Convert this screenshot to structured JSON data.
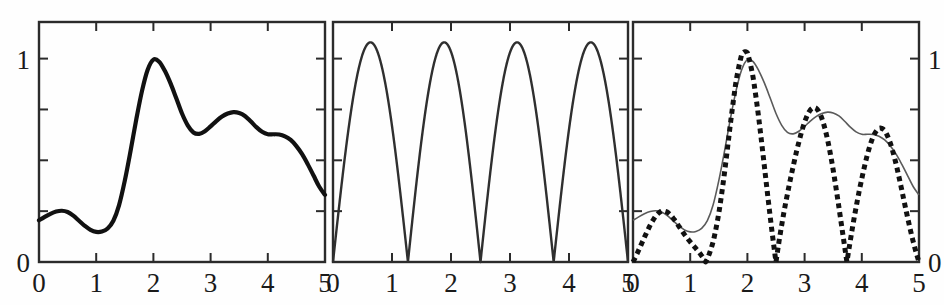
{
  "figure": {
    "title": "",
    "background_color": "#fefefe",
    "line_color": "#111111",
    "thin_line_color": "#4a4a4a",
    "axis_color": "#2b2b2b",
    "panel_count": 3
  },
  "chart_data": [
    {
      "type": "line",
      "panel": "left",
      "title": "",
      "xlabel": "",
      "ylabel": "",
      "xlim": [
        0,
        5
      ],
      "ylim": [
        0,
        1.18
      ],
      "grid": false,
      "legend": null,
      "xticks": [
        0,
        1,
        2,
        3,
        4,
        5
      ],
      "xticklabels": [
        "0",
        "1",
        "2",
        "3",
        "4",
        "5"
      ],
      "yticks": [
        0,
        0.25,
        0.5,
        0.75,
        1
      ],
      "yticklabels_shown": {
        "0": "0",
        "1": "1"
      },
      "ytick_label_side": "left",
      "series": [
        {
          "name": "envelope",
          "style": "solid-thick",
          "color": "#111111",
          "linewidth": 4.2,
          "x": [
            0.0,
            0.1,
            0.2,
            0.3,
            0.4,
            0.5,
            0.6,
            0.7,
            0.8,
            0.9,
            1.0,
            1.1,
            1.2,
            1.3,
            1.4,
            1.5,
            1.6,
            1.7,
            1.8,
            1.9,
            2.0,
            2.1,
            2.2,
            2.3,
            2.4,
            2.5,
            2.6,
            2.7,
            2.8,
            2.9,
            3.0,
            3.1,
            3.2,
            3.3,
            3.4,
            3.5,
            3.6,
            3.7,
            3.8,
            3.9,
            4.0,
            4.1,
            4.2,
            4.3,
            4.4,
            4.5,
            4.6,
            4.7,
            4.8,
            4.9,
            5.0
          ],
          "y": [
            0.205,
            0.222,
            0.237,
            0.248,
            0.252,
            0.246,
            0.228,
            0.203,
            0.178,
            0.158,
            0.148,
            0.15,
            0.165,
            0.203,
            0.28,
            0.4,
            0.545,
            0.7,
            0.84,
            0.945,
            0.995,
            0.985,
            0.94,
            0.878,
            0.805,
            0.73,
            0.672,
            0.637,
            0.63,
            0.643,
            0.667,
            0.693,
            0.715,
            0.73,
            0.737,
            0.733,
            0.718,
            0.692,
            0.663,
            0.64,
            0.628,
            0.628,
            0.627,
            0.618,
            0.6,
            0.57,
            0.53,
            0.48,
            0.425,
            0.37,
            0.33
          ]
        }
      ]
    },
    {
      "type": "line",
      "panel": "middle",
      "title": "",
      "xlabel": "",
      "ylabel": "",
      "xlim": [
        0,
        5
      ],
      "ylim": [
        0,
        1.18
      ],
      "grid": false,
      "legend": null,
      "xticks": [
        0,
        1,
        2,
        3,
        4,
        5
      ],
      "xticklabels": [
        "0",
        "1",
        "2",
        "3",
        "4",
        "5"
      ],
      "yticks": [
        0,
        0.25,
        0.5,
        0.75,
        1
      ],
      "yticklabels_shown": {},
      "ytick_label_side": "none",
      "description": "rectified sinusoid |sin| with zeros at 0, 1.27, 2.50, 3.74, 5.00",
      "function": "abs(sin(pi*x/1.245))",
      "zeros": [
        0.0,
        1.27,
        2.5,
        3.74,
        5.0
      ],
      "peaks_x": [
        0.65,
        1.9,
        3.12,
        4.37
      ],
      "peak_value": 1.08,
      "series": [
        {
          "name": "carrier",
          "style": "solid-thin",
          "color": "#2f2f2f",
          "linewidth": 2.4
        }
      ]
    },
    {
      "type": "line",
      "panel": "right",
      "title": "",
      "xlabel": "",
      "ylabel": "",
      "xlim": [
        0,
        5
      ],
      "ylim": [
        0,
        1.18
      ],
      "grid": false,
      "legend": null,
      "xticks": [
        0,
        1,
        2,
        3,
        4,
        5
      ],
      "xticklabels": [
        "0",
        "1",
        "2",
        "3",
        "4",
        "5"
      ],
      "yticks": [
        0,
        0.25,
        0.5,
        0.75,
        1
      ],
      "yticklabels_shown": {
        "0": "0",
        "1": "1"
      },
      "ytick_label_side": "right",
      "description": "product of left envelope and middle carrier, drawn dotted, overlaid on thin envelope",
      "series": [
        {
          "name": "envelope-reference",
          "style": "solid-thin",
          "color": "#5a5a5a",
          "linewidth": 1.6
        },
        {
          "name": "modulated-product",
          "style": "dotted-thick",
          "color": "#111111",
          "linewidth": 5.0,
          "dash": "5 4"
        }
      ]
    }
  ]
}
